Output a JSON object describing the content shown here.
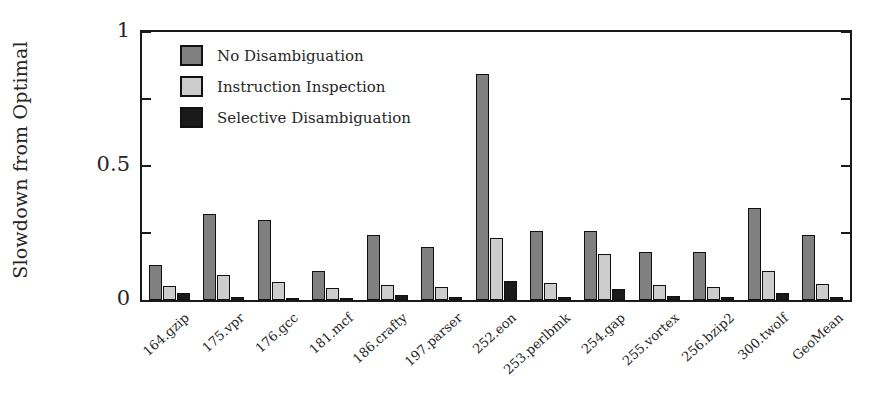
{
  "chart_data": {
    "type": "bar",
    "title": "",
    "xlabel": "",
    "ylabel": "Slowdown from Optimal",
    "ylim": [
      0,
      1
    ],
    "yticks": [
      0,
      0.5,
      1
    ],
    "ytick_labels": [
      "0",
      "0.5",
      "1"
    ],
    "yminor_ticks": [
      0.25,
      0.75
    ],
    "grid": false,
    "legend_position": "upper-left-inside",
    "categories": [
      "164.gzip",
      "175.vpr",
      "176.gcc",
      "181.mcf",
      "186.crafty",
      "197.parser",
      "252.eon",
      "253.perlbmk",
      "254.gap",
      "255.vortex",
      "256.bzip2",
      "300.twolf",
      "GeoMean"
    ],
    "series": [
      {
        "name": "No Disambiguation",
        "color": "#808080",
        "values": [
          0.129,
          0.32,
          0.298,
          0.11,
          0.243,
          0.198,
          0.842,
          0.257,
          0.257,
          0.18,
          0.18,
          0.345,
          0.243
        ]
      },
      {
        "name": "Instruction Inspection",
        "color": "#cccccc",
        "values": [
          0.051,
          0.092,
          0.066,
          0.044,
          0.056,
          0.048,
          0.232,
          0.063,
          0.173,
          0.055,
          0.047,
          0.11,
          0.06
        ]
      },
      {
        "name": "Selective Disambiguation",
        "color": "#1a1a1a",
        "values": [
          0.026,
          0.01,
          0.008,
          0.006,
          0.02,
          0.01,
          0.07,
          0.012,
          0.04,
          0.014,
          0.01,
          0.025,
          0.012
        ]
      }
    ]
  },
  "colors": {
    "axis": "#1a1a1a",
    "background": "#ffffff",
    "text": "#262626"
  }
}
